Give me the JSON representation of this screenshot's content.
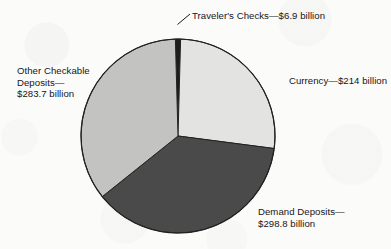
{
  "chart_data": {
    "type": "pie",
    "title": "",
    "subtitle": "",
    "xlabel": "",
    "ylabel": "",
    "units": "billion dollars",
    "legend_position": "none",
    "grid": false,
    "labels_outside": true,
    "total_value": 803.4,
    "categories": [
      "Traveler's Checks",
      "Currency",
      "Demand Deposits",
      "Other Checkable Deposits"
    ],
    "values": [
      6.9,
      214,
      298.8,
      283.7
    ],
    "slices": [
      {
        "name": "Traveler's Checks",
        "value": 6.9,
        "value_text": "$6.9 billion",
        "label_text": "Traveler's Checks—$6.9 billion",
        "percent": 0.86,
        "start_angle": -1.55,
        "sweep_angle": 3.09,
        "color": "#1d1d1d"
      },
      {
        "name": "Currency",
        "value": 214,
        "value_text": "$214 billion",
        "label_text": "Currency—$214 billion",
        "percent": 26.64,
        "start_angle": 1.54,
        "sweep_angle": 95.89,
        "color": "#e3e3e2"
      },
      {
        "name": "Demand Deposits",
        "value": 298.8,
        "value_text": "$298.8 billion",
        "label_text": "Demand Deposits—\n$298.8 billion",
        "percent": 37.19,
        "start_angle": 97.43,
        "sweep_angle": 133.89,
        "color": "#4a4a4a"
      },
      {
        "name": "Other Checkable Deposits",
        "value": 283.7,
        "value_text": "$283.7 billion",
        "label_text": "Other Checkable\nDeposits—\n$283.7 billion",
        "percent": 35.31,
        "start_angle": 231.32,
        "sweep_angle": 127.13,
        "color": "#c3c3c2"
      }
    ],
    "outline_color": "#222222",
    "background_color": "#fbfbfa",
    "center_x": 178,
    "center_y": 136,
    "radius": 97
  },
  "labels": {
    "travelers_checks": "Traveler's Checks—$6.9 billion",
    "currency": "Currency—$214 billion",
    "other_checkable_deposits": "Other Checkable\nDeposits—\n$283.7 billion",
    "demand_deposits": "Demand Deposits—\n$298.8 billion"
  }
}
